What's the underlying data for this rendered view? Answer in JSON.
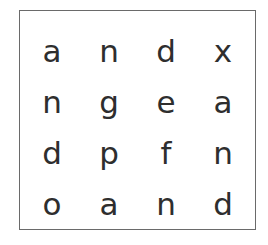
{
  "puzzle": {
    "type": "letter-grid",
    "rows": 4,
    "cols": 4,
    "grid": [
      [
        "a",
        "n",
        "d",
        "x"
      ],
      [
        "n",
        "g",
        "e",
        "a"
      ],
      [
        "d",
        "p",
        "f",
        "n"
      ],
      [
        "o",
        "a",
        "n",
        "d"
      ]
    ],
    "border_color": "#6a6a6a",
    "text_color": "#2e2e2e"
  }
}
